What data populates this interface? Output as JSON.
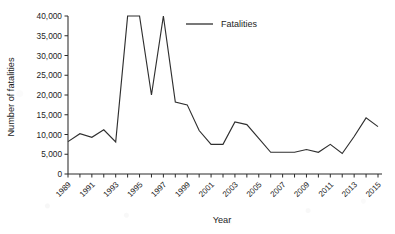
{
  "chart_data": {
    "type": "line",
    "title": "",
    "xlabel": "Year",
    "ylabel": "Number of fatalities",
    "xlim": [
      1989,
      2015
    ],
    "ylim": [
      0,
      40000
    ],
    "grid": false,
    "legend_position": "top-center",
    "y_ticks": [
      0,
      5000,
      10000,
      15000,
      20000,
      25000,
      30000,
      35000,
      40000
    ],
    "y_tick_labels": [
      "0",
      "5,000",
      "10,000",
      "15,000",
      "20,000",
      "25,000",
      "30,000",
      "35,000",
      "40,000"
    ],
    "x_ticks": [
      1989,
      1990,
      1991,
      1992,
      1993,
      1994,
      1995,
      1996,
      1997,
      1998,
      1999,
      2000,
      2001,
      2002,
      2003,
      2004,
      2005,
      2006,
      2007,
      2008,
      2009,
      2010,
      2011,
      2012,
      2013,
      2014,
      2015
    ],
    "x_tick_labels": [
      "1989",
      "",
      "1991",
      "",
      "1993",
      "",
      "1995",
      "",
      "1997",
      "",
      "1999",
      "",
      "2001",
      "",
      "2003",
      "",
      "2005",
      "",
      "2007",
      "",
      "2009",
      "",
      "2011",
      "",
      "2013",
      "",
      "2015"
    ],
    "series": [
      {
        "name": "Fatalities",
        "color": "#2f2f2f",
        "note": "values for 1994, 1995 and 1997 are clipped at the 40,000 axis maximum",
        "x": [
          1989,
          1990,
          1991,
          1992,
          1993,
          1994,
          1995,
          1996,
          1997,
          1998,
          1999,
          2000,
          2001,
          2002,
          2003,
          2004,
          2005,
          2006,
          2007,
          2008,
          2009,
          2010,
          2011,
          2012,
          2013,
          2014,
          2015
        ],
        "values": [
          8200,
          10200,
          9300,
          11200,
          8100,
          40000,
          40000,
          20000,
          40000,
          18200,
          17500,
          11000,
          7500,
          7500,
          13200,
          12500,
          9000,
          5500,
          5500,
          5500,
          6200,
          5500,
          7500,
          5200,
          9500,
          14200,
          12000
        ]
      }
    ],
    "legend": [
      {
        "label": "Fatalities",
        "color": "#2f2f2f"
      }
    ]
  }
}
